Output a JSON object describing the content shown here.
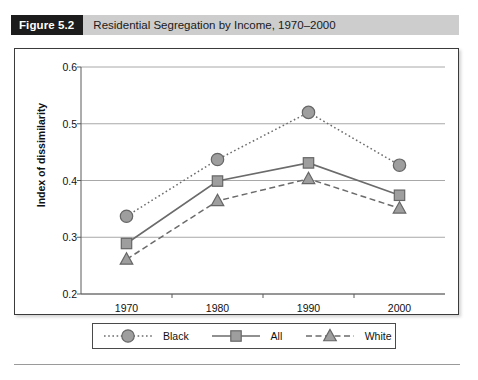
{
  "figure": {
    "badge_label": "Figure 5.2",
    "title": "Residential Segregation by Income, 1970–2000"
  },
  "colors": {
    "badge_background": "#1c1c1c",
    "title_bar_background": "#cdcdcd",
    "frame_border": "#3b3b3b",
    "gridline": "#a8a8a8",
    "axis": "#5a5a5a",
    "marker_fill": "#9e9e9e",
    "marker_stroke": "#666666",
    "series_line": "#6b6b6b",
    "text": "#111111"
  },
  "chart_data": {
    "type": "line",
    "title": "Residential Segregation by Income, 1970–2000",
    "xlabel": "",
    "ylabel": "Index of dissimilarity",
    "categories": [
      "1970",
      "1980",
      "1990",
      "2000"
    ],
    "ylim": [
      0.2,
      0.6
    ],
    "yticks": [
      "0.2",
      "0.3",
      "0.4",
      "0.5",
      "0.6"
    ],
    "ytick_values": [
      0.2,
      0.3,
      0.4,
      0.5,
      0.6
    ],
    "grid": true,
    "legend_position": "bottom",
    "series": [
      {
        "name": "Black",
        "values": [
          0.337,
          0.437,
          0.52,
          0.427
        ],
        "linestyle": "dotted",
        "marker": "circle"
      },
      {
        "name": "All",
        "values": [
          0.289,
          0.399,
          0.431,
          0.374
        ],
        "linestyle": "solid",
        "marker": "square"
      },
      {
        "name": "White",
        "values": [
          0.261,
          0.364,
          0.403,
          0.351
        ],
        "linestyle": "dashed",
        "marker": "triangle"
      }
    ]
  }
}
